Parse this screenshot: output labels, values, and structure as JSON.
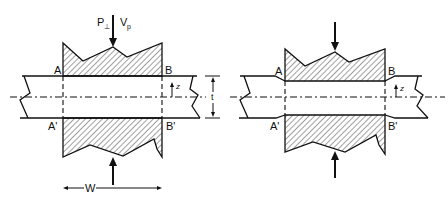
{
  "figure": {
    "panels": [
      {
        "id": "left",
        "variant": "uniform-plate",
        "labels": {
          "top_left": "A",
          "top_right": "B",
          "bottom_left": "A'",
          "bottom_right": "B'",
          "force_perp": "P",
          "force_perp_sub": "⊥",
          "force_shear": "V",
          "force_shear_sub": "p",
          "z_axis": "z",
          "thickness": "t",
          "width": "W"
        }
      },
      {
        "id": "right",
        "variant": "stepped-plate",
        "labels": {
          "top_left": "A",
          "top_right": "B",
          "bottom_left": "A'",
          "bottom_right": "B'",
          "z_axis": "z"
        }
      }
    ]
  }
}
